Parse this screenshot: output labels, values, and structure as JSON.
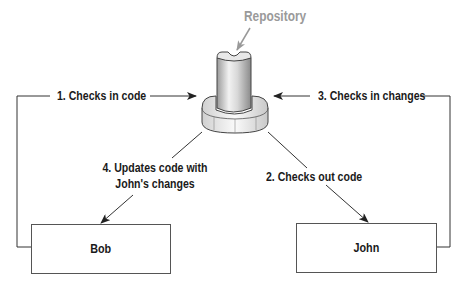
{
  "diagram": {
    "repository": {
      "label": "Repository",
      "label_color": "#9a9a9a"
    },
    "actors": [
      {
        "name": "Bob"
      },
      {
        "name": "John"
      }
    ],
    "steps": [
      {
        "label": "1. Checks in code",
        "from": "Bob",
        "to": "Repository"
      },
      {
        "label": "2. Checks out code",
        "from": "Repository",
        "to": "John"
      },
      {
        "label": "3. Checks in changes",
        "from": "John",
        "to": "Repository"
      },
      {
        "label_line1": "4. Updates code with",
        "label_line2": "John's changes",
        "from": "Repository",
        "to": "Bob"
      }
    ],
    "colors": {
      "line": "#333333",
      "box_border": "#555555",
      "text": "#1a1a1a"
    }
  }
}
